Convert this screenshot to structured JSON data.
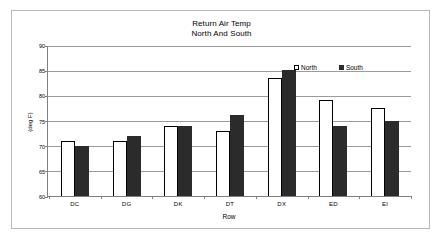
{
  "chart_data": {
    "type": "bar",
    "title": "Return Air Temp",
    "subtitle": "North And South",
    "xlabel": "Row",
    "ylabel": "(deg F)",
    "categories": [
      "DC",
      "DG",
      "DK",
      "DT",
      "DX",
      "ED",
      "EI"
    ],
    "series": [
      {
        "name": "North",
        "color": "#ffffff",
        "values": [
          71,
          71,
          74,
          73,
          83.5,
          79,
          77.5
        ]
      },
      {
        "name": "South",
        "color": "#2b2b2b",
        "values": [
          70,
          72,
          74,
          76,
          85,
          74,
          75
        ]
      }
    ],
    "ylim": [
      60,
      90
    ],
    "yticks": [
      60,
      65,
      70,
      75,
      80,
      85,
      90
    ],
    "ytick_labels": [
      "60",
      "65",
      "70",
      "75",
      "80",
      "85",
      "90"
    ],
    "grid": true,
    "legend_position": "inside-top-right"
  },
  "legend": {
    "north_label": "North",
    "south_label": "South"
  }
}
